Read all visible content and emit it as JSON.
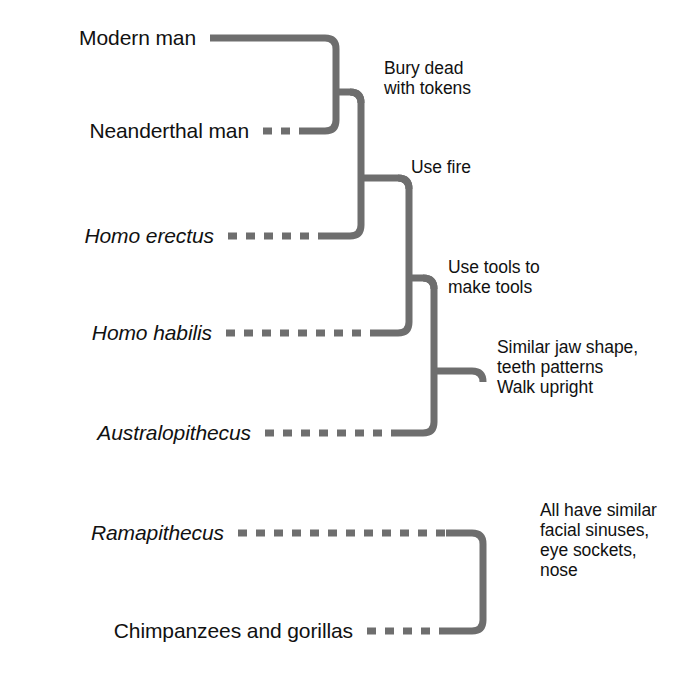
{
  "diagram": {
    "kind": "cladogram",
    "title_visible": false,
    "line_color": "#6e6e6e",
    "text_color": "#111111",
    "background_color": "#ffffff",
    "taxa": [
      {
        "id": "modern-man",
        "label": "Modern man",
        "italic": false,
        "branch_style": "solid",
        "row_y": 38,
        "label_right": 196,
        "branch_end_x": 336
      },
      {
        "id": "neanderthal-man",
        "label": "Neanderthal man",
        "italic": false,
        "branch_style": "dashed",
        "row_y": 131,
        "label_right": 249,
        "branch_end_x": 336
      },
      {
        "id": "homo-erectus",
        "label": "Homo erectus",
        "italic": true,
        "branch_style": "dashed",
        "row_y": 236,
        "label_right": 214,
        "branch_end_x": 361
      },
      {
        "id": "homo-habilis",
        "label": "Homo habilis",
        "italic": true,
        "branch_style": "dashed",
        "row_y": 333,
        "label_right": 212,
        "branch_end_x": 409
      },
      {
        "id": "australopithecus",
        "label": "Australopithecus",
        "italic": true,
        "branch_style": "dashed",
        "row_y": 433,
        "label_right": 251,
        "branch_end_x": 434
      },
      {
        "id": "ramapithecus",
        "label": "Ramapithecus",
        "italic": true,
        "branch_style": "dashed",
        "row_y": 533,
        "label_right": 224,
        "branch_end_x": 483
      },
      {
        "id": "chimpanzees-gorillas",
        "label": "Chimpanzees and gorillas",
        "italic": false,
        "branch_style": "dashed",
        "row_y": 631,
        "label_right": 353,
        "branch_end_x": 483
      }
    ],
    "nodes": [
      {
        "id": "node-bury-dead",
        "junction_x": 336,
        "junction_y": 92,
        "stem_to_x": 361
      },
      {
        "id": "node-use-fire",
        "junction_x": 361,
        "junction_y": 178,
        "stem_to_x": 409
      },
      {
        "id": "node-use-tools",
        "junction_x": 409,
        "junction_y": 278,
        "stem_to_x": 434
      },
      {
        "id": "node-similar-jaw",
        "junction_x": 434,
        "junction_y": 371,
        "stem_to_x": 483
      },
      {
        "id": "node-all-similar",
        "junction_x": 483,
        "junction_y": 455,
        "stem_to_x": 483
      }
    ],
    "annotations": [
      {
        "id": "annotation-bury-dead",
        "text": "Bury dead\nwith tokens",
        "x": 384,
        "y": 58,
        "lines": 2
      },
      {
        "id": "annotation-use-fire",
        "text": "Use fire",
        "x": 411,
        "y": 157,
        "lines": 1
      },
      {
        "id": "annotation-use-tools",
        "text": "Use tools to\nmake tools",
        "x": 448,
        "y": 257,
        "lines": 2
      },
      {
        "id": "annotation-similar-jaw",
        "text": "Similar jaw shape,\nteeth patterns\nWalk upright",
        "x": 497,
        "y": 337,
        "lines": 3
      },
      {
        "id": "annotation-all-similar",
        "text": "All have similar\nfacial sinuses,\neye sockets,\nnose",
        "x": 540,
        "y": 500,
        "lines": 4
      }
    ]
  }
}
